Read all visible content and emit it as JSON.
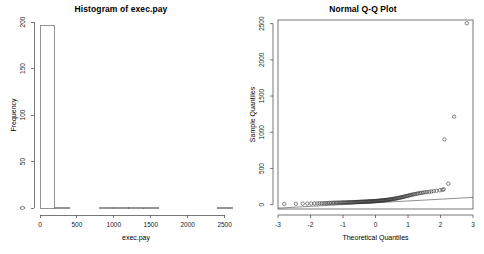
{
  "figure": {
    "background_color": "#ffffff",
    "panel_count": 2
  },
  "panels": {
    "histogram": {
      "title": "Histogram of exec.pay",
      "xlabel": "exec.pay",
      "ylabel": "Frequency"
    },
    "qqplot": {
      "title": "Normal Q-Q Plot",
      "xlabel": "Theoretical Quantiles",
      "ylabel": "Sample Quantiles"
    }
  },
  "chart_data": [
    {
      "type": "bar",
      "subtype": "histogram",
      "title": "Histogram of exec.pay",
      "xlabel": "exec.pay",
      "ylabel": "Frequency",
      "xlim": [
        0,
        2600
      ],
      "ylim": [
        0,
        200
      ],
      "xticks": [
        0,
        500,
        1000,
        1500,
        2000,
        2500
      ],
      "xtick_labels": [
        "0",
        "500",
        "1000",
        "1500",
        "2000",
        "2500"
      ],
      "yticks": [
        0,
        50,
        100,
        150,
        200
      ],
      "ytick_labels": [
        "0",
        "50",
        "100",
        "150",
        "200"
      ],
      "grid": false,
      "legend": "none",
      "bin_width": 200,
      "bin_edges": [
        0,
        200,
        400,
        600,
        800,
        1000,
        1200,
        1400,
        1600,
        1800,
        2000,
        2200,
        2400,
        2600
      ],
      "categories": [
        "0-200",
        "200-400",
        "400-600",
        "600-800",
        "800-1000",
        "1000-1200",
        "1200-1400",
        "1400-1600",
        "1600-1800",
        "1800-2000",
        "2000-2200",
        "2200-2400",
        "2400-2600"
      ],
      "values": [
        196,
        1,
        0,
        0,
        1,
        1,
        1,
        1,
        0,
        0,
        0,
        0,
        1
      ],
      "bar_fill": "#ffffff",
      "bar_stroke": "#666666"
    },
    {
      "type": "scatter",
      "subtype": "qq-plot",
      "title": "Normal Q-Q Plot",
      "xlabel": "Theoretical Quantiles",
      "ylabel": "Sample Quantiles",
      "xlim": [
        -3,
        3
      ],
      "ylim": [
        -60,
        2550
      ],
      "xticks": [
        -3,
        -2,
        -1,
        0,
        1,
        2,
        3
      ],
      "xtick_labels": [
        "-3",
        "-2",
        "-1",
        "0",
        "1",
        "2",
        "3"
      ],
      "yticks": [
        0,
        500,
        1000,
        1500,
        2000,
        2500
      ],
      "ytick_labels": [
        "0",
        "500",
        "1000",
        "1500",
        "2000",
        "2500"
      ],
      "grid": false,
      "legend": "none",
      "reference_line": {
        "x1": -3,
        "y1": -48,
        "x2": 3,
        "y2": 100,
        "stroke": "#444444"
      },
      "point_marker": "open-circle",
      "point_stroke": "#333333",
      "points": [
        [
          -2.81,
          10
        ],
        [
          -2.45,
          12
        ],
        [
          -2.24,
          14
        ],
        [
          -2.1,
          15
        ],
        [
          -1.98,
          16
        ],
        [
          -1.88,
          17
        ],
        [
          -1.79,
          18
        ],
        [
          -1.72,
          19
        ],
        [
          -1.65,
          20
        ],
        [
          -1.58,
          21
        ],
        [
          -1.52,
          22
        ],
        [
          -1.46,
          23
        ],
        [
          -1.41,
          24
        ],
        [
          -1.36,
          25
        ],
        [
          -1.31,
          26
        ],
        [
          -1.27,
          26
        ],
        [
          -1.22,
          27
        ],
        [
          -1.18,
          27
        ],
        [
          -1.14,
          28
        ],
        [
          -1.1,
          28
        ],
        [
          -1.06,
          29
        ],
        [
          -1.03,
          29
        ],
        [
          -0.99,
          30
        ],
        [
          -0.96,
          30
        ],
        [
          -0.92,
          31
        ],
        [
          -0.89,
          31
        ],
        [
          -0.86,
          32
        ],
        [
          -0.83,
          32
        ],
        [
          -0.8,
          33
        ],
        [
          -0.77,
          33
        ],
        [
          -0.74,
          34
        ],
        [
          -0.71,
          34
        ],
        [
          -0.68,
          35
        ],
        [
          -0.65,
          35
        ],
        [
          -0.63,
          36
        ],
        [
          -0.6,
          36
        ],
        [
          -0.57,
          37
        ],
        [
          -0.55,
          37
        ],
        [
          -0.52,
          38
        ],
        [
          -0.49,
          38
        ],
        [
          -0.47,
          39
        ],
        [
          -0.44,
          39
        ],
        [
          -0.42,
          40
        ],
        [
          -0.39,
          40
        ],
        [
          -0.37,
          41
        ],
        [
          -0.34,
          41
        ],
        [
          -0.32,
          42
        ],
        [
          -0.3,
          42
        ],
        [
          -0.27,
          43
        ],
        [
          -0.25,
          43
        ],
        [
          -0.22,
          44
        ],
        [
          -0.2,
          45
        ],
        [
          -0.18,
          45
        ],
        [
          -0.15,
          46
        ],
        [
          -0.13,
          46
        ],
        [
          -0.11,
          47
        ],
        [
          -0.08,
          48
        ],
        [
          -0.06,
          48
        ],
        [
          -0.04,
          49
        ],
        [
          -0.01,
          50
        ],
        [
          0.01,
          50
        ],
        [
          0.04,
          51
        ],
        [
          0.06,
          52
        ],
        [
          0.08,
          53
        ],
        [
          0.11,
          54
        ],
        [
          0.13,
          55
        ],
        [
          0.15,
          56
        ],
        [
          0.18,
          57
        ],
        [
          0.2,
          58
        ],
        [
          0.22,
          59
        ],
        [
          0.25,
          60
        ],
        [
          0.27,
          61
        ],
        [
          0.3,
          62
        ],
        [
          0.32,
          64
        ],
        [
          0.34,
          65
        ],
        [
          0.37,
          66
        ],
        [
          0.39,
          68
        ],
        [
          0.42,
          70
        ],
        [
          0.44,
          71
        ],
        [
          0.47,
          73
        ],
        [
          0.49,
          75
        ],
        [
          0.52,
          77
        ],
        [
          0.55,
          79
        ],
        [
          0.57,
          81
        ],
        [
          0.6,
          83
        ],
        [
          0.63,
          85
        ],
        [
          0.65,
          88
        ],
        [
          0.68,
          90
        ],
        [
          0.71,
          93
        ],
        [
          0.74,
          96
        ],
        [
          0.77,
          99
        ],
        [
          0.8,
          102
        ],
        [
          0.83,
          105
        ],
        [
          0.86,
          108
        ],
        [
          0.89,
          112
        ],
        [
          0.92,
          115
        ],
        [
          0.96,
          119
        ],
        [
          0.99,
          123
        ],
        [
          1.03,
          127
        ],
        [
          1.06,
          131
        ],
        [
          1.1,
          135
        ],
        [
          1.14,
          139
        ],
        [
          1.18,
          143
        ],
        [
          1.22,
          147
        ],
        [
          1.27,
          151
        ],
        [
          1.31,
          155
        ],
        [
          1.36,
          159
        ],
        [
          1.41,
          163
        ],
        [
          1.46,
          166
        ],
        [
          1.52,
          170
        ],
        [
          1.58,
          174
        ],
        [
          1.65,
          178
        ],
        [
          1.72,
          182
        ],
        [
          1.79,
          186
        ],
        [
          1.88,
          192
        ],
        [
          1.98,
          198
        ],
        [
          2.06,
          205
        ],
        [
          2.1,
          212
        ],
        [
          2.24,
          290
        ],
        [
          2.12,
          900
        ],
        [
          2.42,
          1215
        ],
        [
          2.81,
          2505
        ]
      ],
      "outliers": [
        {
          "x": 2.81,
          "y": 2505
        },
        {
          "x": 2.42,
          "y": 1215
        },
        {
          "x": 2.12,
          "y": 900
        },
        {
          "x": 2.24,
          "y": 290
        }
      ],
      "n_points": 201
    }
  ]
}
